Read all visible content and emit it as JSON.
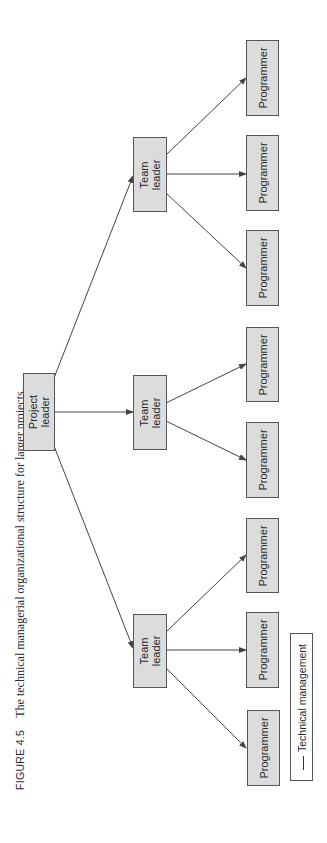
{
  "caption": {
    "figure_label": "FIGURE 4.5",
    "text": "The technical managerial organizational structure for larger projects."
  },
  "nodes": {
    "project_leader": "Project\nleader",
    "team_leaders": [
      "Team\nleader",
      "Team\nleader",
      "Team\nleader"
    ],
    "programmers": [
      "Programmer",
      "Programmer",
      "Programmer",
      "Programmer",
      "Programmer",
      "Programmer",
      "Programmer",
      "Programmer"
    ]
  },
  "structure": {
    "root": "Project leader",
    "children": [
      {
        "name": "Team leader",
        "children": [
          "Programmer",
          "Programmer",
          "Programmer"
        ]
      },
      {
        "name": "Team leader",
        "children": [
          "Programmer",
          "Programmer"
        ]
      },
      {
        "name": "Team leader",
        "children": [
          "Programmer",
          "Programmer",
          "Programmer"
        ]
      }
    ]
  },
  "legend": {
    "items": [
      {
        "label": "Technical management",
        "style": "solid-line"
      }
    ]
  },
  "colors": {
    "box_fill": "#dcdcdc",
    "box_border": "#555555",
    "line": "#444444"
  }
}
